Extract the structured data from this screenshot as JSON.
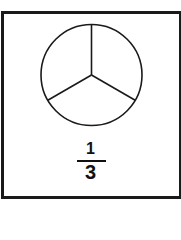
{
  "diagram": {
    "type": "fraction-pie",
    "slices": 3,
    "shaded": 0,
    "fraction": {
      "numerator": "1",
      "denominator": "3"
    },
    "colors": {
      "stroke": "#1a1a1a",
      "background": "#ffffff"
    }
  }
}
